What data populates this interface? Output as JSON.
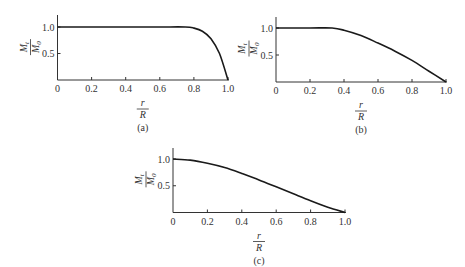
{
  "chart_data": [
    {
      "type": "line",
      "caption": "(a)",
      "title": "",
      "xlabel": "r/R",
      "ylabel": "M_t/M_0",
      "xlim": [
        0,
        1.0
      ],
      "ylim": [
        0,
        1.0
      ],
      "xticks": [
        "0",
        "0.2",
        "0.4",
        "0.6",
        "0.8",
        "1.0"
      ],
      "yticks": [
        "0.5",
        "1.0"
      ],
      "grid": false,
      "series": [
        {
          "name": "M_t/M_0",
          "x": [
            0,
            0.2,
            0.4,
            0.6,
            0.75,
            0.8,
            0.85,
            0.9,
            0.95,
            1.0
          ],
          "y": [
            1.0,
            1.0,
            1.0,
            1.0,
            1.0,
            0.98,
            0.92,
            0.78,
            0.5,
            0.0
          ]
        }
      ]
    },
    {
      "type": "line",
      "caption": "(b)",
      "title": "",
      "xlabel": "r/R",
      "ylabel": "M_t/M_0",
      "xlim": [
        0,
        1.0
      ],
      "ylim": [
        0,
        1.0
      ],
      "xticks": [
        "0",
        "0.2",
        "0.4",
        "0.6",
        "0.8",
        "1.0"
      ],
      "yticks": [
        "0.5",
        "1.0"
      ],
      "grid": false,
      "series": [
        {
          "name": "M_t/M_0",
          "x": [
            0,
            0.2,
            0.33,
            0.4,
            0.5,
            0.6,
            0.7,
            0.8,
            0.9,
            1.0
          ],
          "y": [
            1.0,
            1.0,
            1.0,
            0.96,
            0.86,
            0.72,
            0.57,
            0.4,
            0.2,
            0.0
          ]
        }
      ]
    },
    {
      "type": "line",
      "caption": "(c)",
      "title": "",
      "xlabel": "r/R",
      "ylabel": "M_t/M_0",
      "xlim": [
        0,
        1.0
      ],
      "ylim": [
        0,
        1.0
      ],
      "xticks": [
        "0",
        "0.2",
        "0.4",
        "0.6",
        "0.8",
        "1.0"
      ],
      "yticks": [
        "0.5",
        "1.0"
      ],
      "grid": false,
      "series": [
        {
          "name": "M_t/M_0",
          "x": [
            0,
            0.1,
            0.2,
            0.3,
            0.4,
            0.5,
            0.6,
            0.7,
            0.8,
            0.9,
            1.0
          ],
          "y": [
            1.0,
            0.98,
            0.92,
            0.84,
            0.73,
            0.61,
            0.48,
            0.35,
            0.22,
            0.1,
            0.0
          ]
        }
      ]
    }
  ],
  "labels": {
    "ylabel_num": "M",
    "ylabel_num_sub": "t",
    "ylabel_den": "M",
    "ylabel_den_sub": "0",
    "xlabel_num": "r",
    "xlabel_den": "R"
  }
}
